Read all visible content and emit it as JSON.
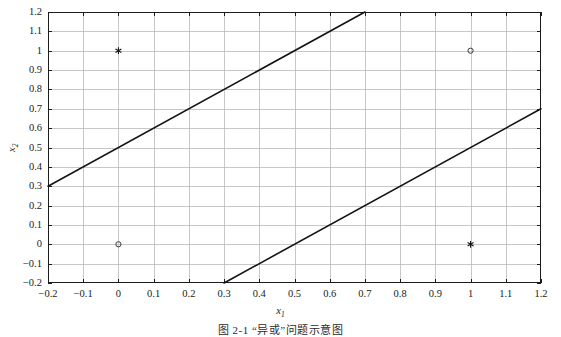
{
  "figure": {
    "caption": "图 2-1  “异或”问题示意图",
    "background_color": "#ffffff",
    "axis_color": "#1c1c1c",
    "grid_color": "#b9b9b9",
    "line_color": "#141414"
  },
  "chart_data": {
    "type": "scatter",
    "title": "",
    "xlabel": "x1",
    "ylabel": "x2",
    "xlim": [
      -0.2,
      1.2
    ],
    "ylim": [
      -0.2,
      1.2
    ],
    "grid": true,
    "legend": "none",
    "xticks": [
      -0.2,
      -0.1,
      0,
      0.1,
      0.2,
      0.3,
      0.4,
      0.5,
      0.6,
      0.7,
      0.8,
      0.9,
      1,
      1.1,
      1.2
    ],
    "yticks": [
      -0.2,
      -0.1,
      0,
      0.1,
      0.2,
      0.3,
      0.4,
      0.5,
      0.6,
      0.7,
      0.8,
      0.9,
      1,
      1.1,
      1.2
    ],
    "xtick_labels": [
      "-0.2",
      "-0.1",
      "0",
      "0.1",
      "0.2",
      "0.3",
      "0.4",
      "0.5",
      "0.6",
      "0.7",
      "0.8",
      "0.9",
      "1",
      "1.1",
      "1.2"
    ],
    "ytick_labels": [
      "-0.2",
      "-0.1",
      "0",
      "0.1",
      "0.2",
      "0.3",
      "0.4",
      "0.5",
      "0.6",
      "0.7",
      "0.8",
      "0.9",
      "1",
      "1.1",
      "1.2"
    ],
    "series": [
      {
        "name": "class-asterisk",
        "marker": "asterisk",
        "points": [
          {
            "x": 0,
            "y": 1
          },
          {
            "x": 1,
            "y": 0
          }
        ]
      },
      {
        "name": "class-circle",
        "marker": "circle",
        "points": [
          {
            "x": 0,
            "y": 0
          },
          {
            "x": 1,
            "y": 1
          }
        ]
      }
    ],
    "lines": [
      {
        "name": "upper-decision-boundary",
        "equation": "x2 = x1 + 0.5",
        "x": [
          -0.2,
          0.7
        ],
        "y": [
          0.3,
          1.2
        ]
      },
      {
        "name": "lower-decision-boundary",
        "equation": "x2 = x1 - 0.5",
        "x": [
          0.3,
          1.2
        ],
        "y": [
          -0.2,
          0.7
        ]
      }
    ]
  }
}
